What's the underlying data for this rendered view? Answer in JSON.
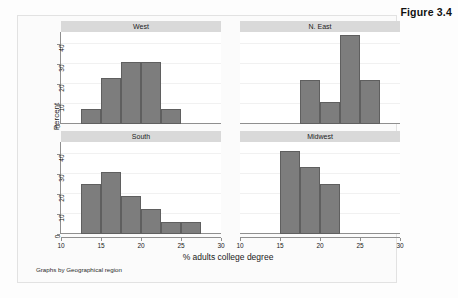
{
  "figure": {
    "caption": "Figure 3.4",
    "note": "Graphs by Geographical region",
    "ylabel": "Percent",
    "xlabel": "% adults college degree"
  },
  "colors": {
    "bar_fill": "#7d7d7d",
    "bar_border": "#5f5f5f",
    "strip": "#d9d9d9",
    "axis": "#8f8f8f",
    "grid": "#f1f1f1",
    "panel_bg": "#ffffff",
    "frame_bg": "#fbfbfb"
  },
  "axes": {
    "y_ticks": [
      "0",
      "10",
      "20",
      "30",
      "40"
    ],
    "y_values": [
      0,
      10,
      20,
      30,
      40
    ],
    "y_min": 0,
    "y_max": 46,
    "x_ticks": [
      "10",
      "15",
      "20",
      "25",
      "30"
    ],
    "x_values": [
      10,
      15,
      20,
      25,
      30
    ],
    "x_min": 10,
    "x_max": 30
  },
  "chart_data": {
    "type": "bar",
    "title": "Figure 3.4",
    "subtitle": "Graphs by Geographical region",
    "xlabel": "% adults college degree",
    "ylabel": "Percent",
    "xlim": [
      10,
      30
    ],
    "ylim": [
      0,
      46
    ],
    "grid": true,
    "legend": "none",
    "layout": "2x2 faceted histogram",
    "facet_variable": "Geographical region",
    "bin_width": 2.5,
    "panels": [
      {
        "label": "West",
        "row": 0,
        "col": 0,
        "bins": [
          {
            "x0": 12.5,
            "x1": 15.0,
            "value": 7.7
          },
          {
            "x0": 15.0,
            "x1": 17.5,
            "value": 23.1
          },
          {
            "x0": 17.5,
            "x1": 20.0,
            "value": 30.8
          },
          {
            "x0": 20.0,
            "x1": 22.5,
            "value": 30.8
          },
          {
            "x0": 22.5,
            "x1": 25.0,
            "value": 7.7
          }
        ]
      },
      {
        "label": "N. East",
        "row": 0,
        "col": 1,
        "bins": [
          {
            "x0": 17.5,
            "x1": 20.0,
            "value": 22.2
          },
          {
            "x0": 20.0,
            "x1": 22.5,
            "value": 11.1
          },
          {
            "x0": 22.5,
            "x1": 25.0,
            "value": 44.4
          },
          {
            "x0": 25.0,
            "x1": 27.5,
            "value": 22.2
          }
        ]
      },
      {
        "label": "South",
        "row": 1,
        "col": 0,
        "bins": [
          {
            "x0": 12.5,
            "x1": 15.0,
            "value": 25.0
          },
          {
            "x0": 15.0,
            "x1": 17.5,
            "value": 31.2
          },
          {
            "x0": 17.5,
            "x1": 20.0,
            "value": 18.8
          },
          {
            "x0": 20.0,
            "x1": 22.5,
            "value": 12.5
          },
          {
            "x0": 22.5,
            "x1": 25.0,
            "value": 6.2
          },
          {
            "x0": 25.0,
            "x1": 27.5,
            "value": 6.2
          }
        ]
      },
      {
        "label": "Midwest",
        "row": 1,
        "col": 1,
        "bins": [
          {
            "x0": 15.0,
            "x1": 17.5,
            "value": 41.7
          },
          {
            "x0": 17.5,
            "x1": 20.0,
            "value": 33.3
          },
          {
            "x0": 20.0,
            "x1": 22.5,
            "value": 25.0
          }
        ]
      }
    ]
  }
}
